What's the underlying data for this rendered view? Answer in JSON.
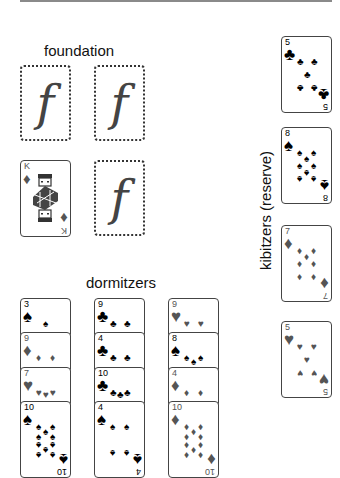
{
  "labels": {
    "foundation": "foundation",
    "dormitzers": "dormitzers",
    "reserve": "kibitzers (reserve)"
  },
  "foundation": {
    "slots": [
      {
        "empty": true,
        "glyph": "f"
      },
      {
        "empty": true,
        "glyph": "f"
      },
      {
        "empty": false,
        "rank": "K",
        "suit": "diamonds",
        "suit_glyph": "♦"
      },
      {
        "empty": true,
        "glyph": "f"
      }
    ]
  },
  "reserve": {
    "cards": [
      {
        "rank": "5",
        "suit": "clubs",
        "suit_glyph": "♣"
      },
      {
        "rank": "8",
        "suit": "spades",
        "suit_glyph": "♠"
      },
      {
        "rank": "7",
        "suit": "diamonds",
        "suit_glyph": "♦"
      },
      {
        "rank": "5",
        "suit": "hearts",
        "suit_glyph": "♥"
      }
    ]
  },
  "dormitzers": {
    "columns": [
      {
        "cards": [
          {
            "rank": "3",
            "suit": "spades",
            "suit_glyph": "♠"
          },
          {
            "rank": "9",
            "suit": "diamonds",
            "suit_glyph": "♦"
          },
          {
            "rank": "7",
            "suit": "hearts",
            "suit_glyph": "♥"
          },
          {
            "rank": "10",
            "suit": "spades",
            "suit_glyph": "♠"
          }
        ]
      },
      {
        "cards": [
          {
            "rank": "9",
            "suit": "clubs",
            "suit_glyph": "♣"
          },
          {
            "rank": "4",
            "suit": "clubs",
            "suit_glyph": "♣"
          },
          {
            "rank": "10",
            "suit": "clubs",
            "suit_glyph": "♣"
          },
          {
            "rank": "4",
            "suit": "spades",
            "suit_glyph": "♠"
          }
        ]
      },
      {
        "cards": [
          {
            "rank": "9",
            "suit": "hearts",
            "suit_glyph": "♥"
          },
          {
            "rank": "8",
            "suit": "spades",
            "suit_glyph": "♠"
          },
          {
            "rank": "4",
            "suit": "diamonds",
            "suit_glyph": "♦"
          },
          {
            "rank": "10",
            "suit": "diamonds",
            "suit_glyph": "♦"
          }
        ]
      }
    ]
  },
  "colors": {
    "black_suit": "#000000",
    "red_suit": "#555555",
    "card_border": "#444444",
    "background": "#ffffff"
  }
}
